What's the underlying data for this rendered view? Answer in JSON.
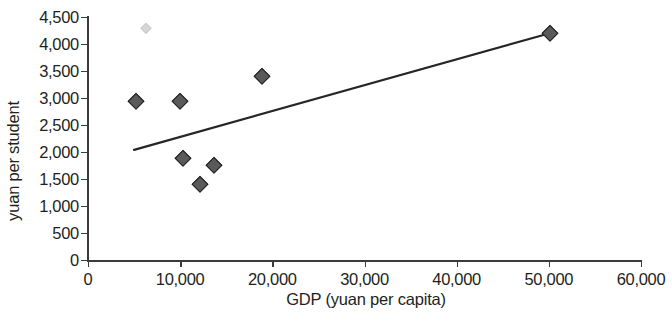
{
  "chart_data": {
    "type": "scatter",
    "title": "",
    "xlabel": "GDP (yuan per capita)",
    "ylabel": "yuan per student",
    "xlim": [
      0,
      60000
    ],
    "ylim": [
      0,
      4500
    ],
    "xticks": [
      0,
      10000,
      20000,
      30000,
      40000,
      50000,
      60000
    ],
    "yticks": [
      0,
      500,
      1000,
      1500,
      2000,
      2500,
      3000,
      3500,
      4000,
      4500
    ],
    "xticklabels": [
      "0",
      "10,000",
      "20,000",
      "30,000",
      "40,000",
      "50,000",
      "60,000"
    ],
    "yticklabels": [
      "0",
      "500",
      "1,000",
      "1,500",
      "2,000",
      "2,500",
      "3,000",
      "3,500",
      "4,000",
      "4,500"
    ],
    "grid": false,
    "legend": null,
    "marker_style": "diamond",
    "marker_color": "#5a5a5a",
    "marker_edge_color": "#1d1d1d",
    "trendline_color": "#262626",
    "points": [
      {
        "x": 5200,
        "y": 2950,
        "faint": false
      },
      {
        "x": 6300,
        "y": 4300,
        "faint": true
      },
      {
        "x": 10000,
        "y": 2950,
        "faint": false
      },
      {
        "x": 10300,
        "y": 1890,
        "faint": false
      },
      {
        "x": 12200,
        "y": 1400,
        "faint": false
      },
      {
        "x": 13700,
        "y": 1760,
        "faint": false
      },
      {
        "x": 18900,
        "y": 3400,
        "faint": false
      },
      {
        "x": 50100,
        "y": 4200,
        "faint": false
      }
    ],
    "trendline": {
      "x0": 5000,
      "y0": 2040,
      "x1": 50100,
      "y1": 4200
    }
  }
}
